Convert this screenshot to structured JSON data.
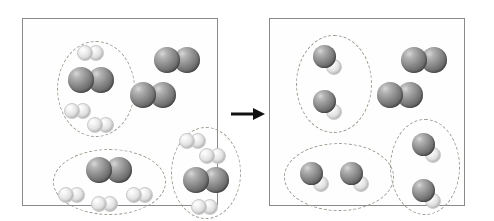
{
  "diagram": {
    "type": "before-after reaction box diagram",
    "arrow": {
      "name": "reaction-arrow",
      "direction": "right",
      "color": "#111111"
    },
    "legend": {
      "dark_atom_label": "dark large atom",
      "light_atom_label": "light small atom",
      "dark_color": "#6e6e6e",
      "light_color": "#e9e9e9",
      "box_border_color": "#8a8a8a",
      "dashed_group_color": "#9a9a8f"
    },
    "panels": [
      {
        "id": "reactants",
        "name": "reactant-box",
        "caption": "",
        "groups": [
          {
            "id": "r-group-1",
            "name": "reactant-group-top-left",
            "shape": "ellipse",
            "x": 34,
            "y": 22,
            "w": 78,
            "h": 96,
            "contents": [
              {
                "kind": "b2",
                "x": 20,
                "y": 4,
                "label": "light diatomic"
              },
              {
                "kind": "a2",
                "x": 11,
                "y": 26,
                "label": "dark diatomic"
              },
              {
                "kind": "b2",
                "x": 7,
                "y": 62,
                "label": "light diatomic"
              },
              {
                "kind": "b2",
                "x": 30,
                "y": 76,
                "label": "light diatomic"
              }
            ]
          },
          {
            "id": "r-group-2",
            "name": "reactant-group-bottom-left",
            "shape": "ellipse",
            "x": 30,
            "y": 130,
            "w": 113,
            "h": 66,
            "contents": [
              {
                "kind": "a2",
                "x": 33,
                "y": 8,
                "label": "dark diatomic"
              },
              {
                "kind": "b2",
                "x": 5,
                "y": 38,
                "label": "light diatomic"
              },
              {
                "kind": "b2",
                "x": 73,
                "y": 38,
                "label": "light diatomic"
              },
              {
                "kind": "b2",
                "x": 38,
                "y": 47,
                "label": "light diatomic"
              }
            ]
          },
          {
            "id": "r-group-3",
            "name": "reactant-group-bottom-right",
            "shape": "ellipse",
            "x": 148,
            "y": 108,
            "w": 70,
            "h": 92,
            "contents": [
              {
                "kind": "b2",
                "x": 8,
                "y": 6,
                "label": "light diatomic"
              },
              {
                "kind": "b2",
                "x": 28,
                "y": 21,
                "label": "light diatomic"
              },
              {
                "kind": "a2",
                "x": 12,
                "y": 40,
                "label": "dark diatomic"
              },
              {
                "kind": "b2",
                "x": 20,
                "y": 72,
                "label": "light diatomic"
              }
            ]
          }
        ],
        "free_molecules": [
          {
            "kind": "a2",
            "name": "excess-reactant-1",
            "x": 131,
            "y": 28,
            "label": "dark diatomic"
          },
          {
            "kind": "a2",
            "name": "excess-reactant-2",
            "x": 107,
            "y": 63,
            "label": "dark diatomic"
          }
        ],
        "counts": {
          "dark_diatomic_total": 5,
          "light_diatomic_total": 9,
          "grouped_sets": 3,
          "free_dark_diatomic": 2
        }
      },
      {
        "id": "products",
        "name": "product-box",
        "caption": "",
        "groups": [
          {
            "id": "p-group-1",
            "name": "product-group-top-left",
            "shape": "ellipse",
            "x": 26,
            "y": 16,
            "w": 76,
            "h": 98,
            "contents": [
              {
                "kind": "ab",
                "x": 17,
                "y": 10,
                "label": "product molecule"
              },
              {
                "kind": "ab",
                "x": 17,
                "y": 55,
                "label": "product molecule"
              }
            ]
          },
          {
            "id": "p-group-2",
            "name": "product-group-bottom-left",
            "shape": "ellipse",
            "x": 14,
            "y": 124,
            "w": 110,
            "h": 68,
            "contents": [
              {
                "kind": "ab",
                "x": 16,
                "y": 19,
                "label": "product molecule"
              },
              {
                "kind": "ab",
                "x": 56,
                "y": 19,
                "label": "product molecule"
              }
            ]
          },
          {
            "id": "p-group-3",
            "name": "product-group-bottom-right",
            "shape": "ellipse",
            "x": 120,
            "y": 100,
            "w": 70,
            "h": 96,
            "contents": [
              {
                "kind": "ab",
                "x": 22,
                "y": 14,
                "label": "product molecule"
              },
              {
                "kind": "ab",
                "x": 22,
                "y": 60,
                "label": "product molecule"
              }
            ]
          }
        ],
        "free_molecules": [
          {
            "kind": "a2",
            "name": "leftover-reactant-1",
            "x": 131,
            "y": 28,
            "label": "dark diatomic"
          },
          {
            "kind": "a2",
            "name": "leftover-reactant-2",
            "x": 107,
            "y": 63,
            "label": "dark diatomic"
          }
        ],
        "counts": {
          "product_molecules_total": 6,
          "grouped_sets": 3,
          "free_dark_diatomic": 2
        }
      }
    ]
  }
}
